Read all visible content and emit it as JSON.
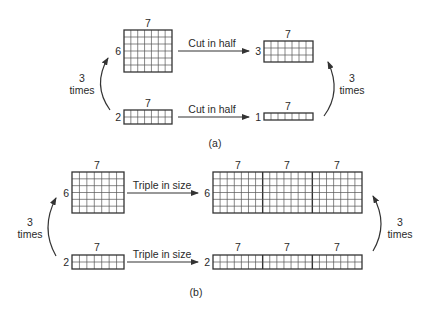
{
  "panel_a": {
    "caption": "(a)",
    "top": {
      "left_grid": {
        "rows": 6,
        "cols": 7,
        "row_label": "6",
        "col_label": "7"
      },
      "arrow_label": "Cut in half",
      "right_grid": {
        "rows": 3,
        "cols": 7,
        "row_label": "3",
        "col_label": "7"
      }
    },
    "bottom": {
      "left_grid": {
        "rows": 2,
        "cols": 7,
        "row_label": "2",
        "col_label": "7"
      },
      "arrow_label": "Cut in half",
      "right_grid": {
        "rows": 1,
        "cols": 7,
        "row_label": "1",
        "col_label": "7"
      }
    },
    "left_curve": {
      "line1": "3",
      "line2": "times"
    },
    "right_curve": {
      "line1": "3",
      "line2": "times"
    }
  },
  "panel_b": {
    "caption": "(b)",
    "top": {
      "left_grid": {
        "rows": 6,
        "cols": 7,
        "row_label": "6",
        "col_label": "7"
      },
      "arrow_label": "Triple in size",
      "right_grid": {
        "rows": 6,
        "cols": 21,
        "blocks": 3,
        "row_label": "6",
        "col_labels": [
          "7",
          "7",
          "7"
        ]
      }
    },
    "bottom": {
      "left_grid": {
        "rows": 2,
        "cols": 7,
        "row_label": "2",
        "col_label": "7"
      },
      "arrow_label": "Triple in size",
      "right_grid": {
        "rows": 2,
        "cols": 21,
        "blocks": 3,
        "row_label": "2",
        "col_labels": [
          "7",
          "7",
          "7"
        ]
      }
    },
    "left_curve": {
      "line1": "3",
      "line2": "times"
    },
    "right_curve": {
      "line1": "3",
      "line2": "times"
    }
  }
}
